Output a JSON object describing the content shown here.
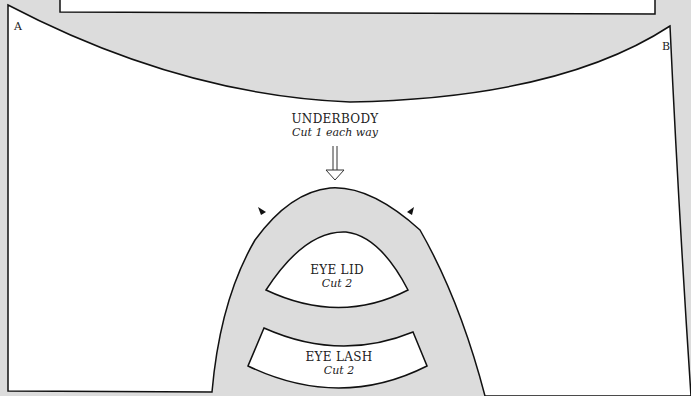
{
  "pattern": {
    "corner_a": "A",
    "corner_b": "B",
    "underbody": {
      "title": "UNDERBODY",
      "instruction": "Cut 1 each way"
    },
    "eye_lid": {
      "title": "EYE LID",
      "instruction": "Cut 2"
    },
    "eye_lash": {
      "title": "EYE LASH",
      "instruction": "Cut 2"
    },
    "colors": {
      "background": "#dcdcdc",
      "piece": "#ffffff",
      "outline": "#111111"
    }
  }
}
